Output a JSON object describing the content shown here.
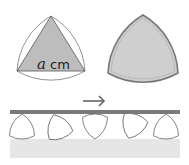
{
  "figure": {
    "left_panel": {
      "description": "Equilateral triangle inscribed in a Reuleaux triangle",
      "side_label_variable": "a",
      "side_label_unit": " cm",
      "triangle_fill": "#bdbdbd",
      "stroke": "#555555"
    },
    "right_panel": {
      "description": "Filled Reuleaux triangle",
      "fill": "#cfcfcf",
      "stroke": "#777777"
    },
    "bottom_panel": {
      "description": "Reuleaux triangles rolling between a moving board and the ground",
      "arrow": "→",
      "board_color": "#7a7a7a",
      "ground_color": "#e6e6e6",
      "roller_count": 5
    }
  }
}
